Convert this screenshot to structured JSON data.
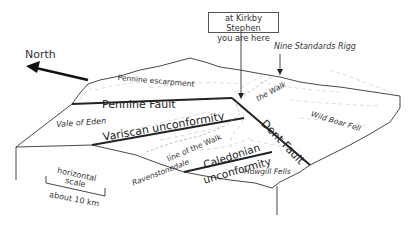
{
  "diagram": {
    "type": "geological block diagram",
    "north_label": "North",
    "callout": {
      "line1": "at Kirkby Stephen",
      "line2": "you are here"
    },
    "landmarks": {
      "nine_standards_rigg": "Nine Standards Rigg",
      "pennine_escarpment": "Pennine escarpment",
      "the_walk": "the Walk",
      "wild_boar_fell": "Wild Boar Fell",
      "vale_of_eden": "Vale of Eden",
      "line_of_the_walk": "line of the Walk",
      "ravenstonedale": "Ravenstonedale",
      "howgill_fells": "Howgill Fells"
    },
    "structures": {
      "pennine_fault": "Pennine Fault",
      "variscan_unconformity": "Variscan unconformity",
      "dent_fault": "Dent Fault",
      "caledonian_line1": "Caledonian",
      "caledonian_line2": "unconformity"
    },
    "scale": {
      "line1": "horizontal",
      "line2": "scale",
      "line3": "about 10 km"
    },
    "colors": {
      "line": "#333333",
      "thick_line": "#222222",
      "dashed": "#bbbbbb",
      "text": "#333333"
    }
  }
}
